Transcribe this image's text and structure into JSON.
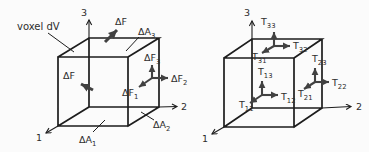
{
  "colors": {
    "bg": "#fbfbfb",
    "edge": "#1d1d1d",
    "arrow": "#414141",
    "text": "#2d2d2d"
  },
  "left_panel": {
    "caption": "voxel dV",
    "axes": {
      "axis1": "1",
      "axis2": "2",
      "axis3": "3"
    },
    "labels": {
      "df_top": {
        "main": "ΔF",
        "sub": ""
      },
      "da3": {
        "main": "ΔA",
        "sub": "3"
      },
      "df3": {
        "main": "ΔF",
        "sub": "3"
      },
      "df2": {
        "main": "ΔF",
        "sub": "2"
      },
      "df1": {
        "main": "ΔF",
        "sub": "1"
      },
      "df_left": {
        "main": "ΔF",
        "sub": ""
      },
      "da1": {
        "main": "ΔA",
        "sub": "1"
      },
      "da2": {
        "main": "ΔA",
        "sub": "2"
      }
    }
  },
  "right_panel": {
    "axes": {
      "axis1": "1",
      "axis2": "2",
      "axis3": "3"
    },
    "labels": {
      "t33": {
        "main": "T",
        "sub": "33"
      },
      "t32": {
        "main": "T",
        "sub": "32"
      },
      "t31": {
        "main": "T",
        "sub": "31"
      },
      "t13": {
        "main": "T",
        "sub": "13"
      },
      "t12": {
        "main": "T",
        "sub": "12"
      },
      "t11": {
        "main": "T",
        "sub": "11"
      },
      "t23": {
        "main": "T",
        "sub": "23"
      },
      "t22": {
        "main": "T",
        "sub": "22"
      },
      "t21": {
        "main": "T",
        "sub": "21"
      }
    }
  }
}
